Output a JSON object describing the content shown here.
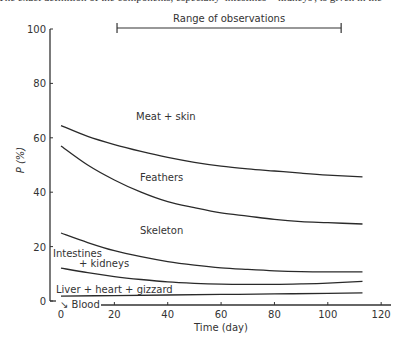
{
  "caption_fragment": "The exact definition of the components, especially 'intestines + kidneys', is given in the",
  "chart_data": {
    "type": "line",
    "title": "",
    "xlabel": "Time (day)",
    "ylabel": "P (%)",
    "xlim": [
      0,
      120
    ],
    "ylim": [
      0,
      100
    ],
    "xticks": [
      0,
      20,
      40,
      60,
      80,
      100,
      120
    ],
    "yticks": [
      0,
      20,
      40,
      60,
      80,
      100
    ],
    "grid": false,
    "annotation": {
      "text": "Range of observations",
      "x_start": 21,
      "x_end": 105
    },
    "series": [
      {
        "name": "Meat + skin",
        "label_x": 98,
        "label_y": 68,
        "x": [
          0,
          10,
          20,
          30,
          40,
          50,
          60,
          70,
          80,
          90,
          100,
          113
        ],
        "y": [
          64.5,
          60.5,
          57.5,
          55,
          52.8,
          51,
          49.6,
          48.6,
          47.8,
          47,
          46.3,
          45.6
        ]
      },
      {
        "name": "Feathers",
        "label_x": 100,
        "label_y": 44,
        "x": [
          0,
          10,
          20,
          30,
          40,
          50,
          60,
          70,
          80,
          90,
          100,
          113
        ],
        "y": [
          57,
          50,
          44.5,
          40,
          36.5,
          34.3,
          32.4,
          31.2,
          30,
          29.2,
          28.8,
          28.3
        ]
      },
      {
        "name": "Skeleton",
        "label_x": 100,
        "label_y": 30,
        "x": [
          0,
          10,
          20,
          30,
          40,
          50,
          60,
          70,
          80,
          90,
          100,
          113
        ],
        "y": [
          25,
          21.5,
          18.5,
          16.3,
          14.5,
          13.2,
          12.2,
          11.6,
          11.1,
          10.8,
          10.7,
          10.7
        ]
      },
      {
        "name": "Intestines + kidneys",
        "label_x": 18,
        "label_y": 17,
        "x": [
          0,
          10,
          20,
          30,
          40,
          50,
          60,
          70,
          80,
          90,
          100,
          113
        ],
        "y": [
          12.1,
          10.4,
          9,
          7.9,
          7,
          6.5,
          6.2,
          6.1,
          6.1,
          6.3,
          6.6,
          7.2
        ]
      },
      {
        "name": "Liver + heart + gizzard",
        "label_x": 16,
        "label_y": 3,
        "x": [
          0,
          20,
          40,
          60,
          80,
          100,
          113
        ],
        "y": [
          1.8,
          2,
          2.2,
          2.4,
          2.6,
          2.8,
          3
        ]
      },
      {
        "name": "Blood",
        "label_x": 12,
        "label_y": -1,
        "x": [],
        "y": []
      }
    ]
  }
}
